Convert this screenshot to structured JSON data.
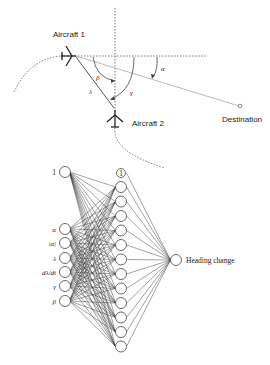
{
  "geometry_diagram": {
    "labels": {
      "aircraft1": "Aircraft 1",
      "aircraft2": "Aircraft 2",
      "destination": "Destination",
      "alpha": "α",
      "beta": "β",
      "gamma": "γ",
      "lambda": "λ"
    }
  },
  "network": {
    "input_labels": [
      "1",
      "α",
      "|α|",
      "λ",
      "dλ/dt",
      "γ",
      "β"
    ],
    "hidden_bias_label": "1",
    "hidden_count": 12,
    "output_label": "Heading change"
  }
}
